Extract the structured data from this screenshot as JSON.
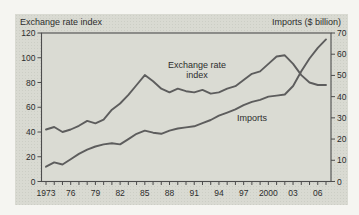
{
  "header": {
    "left": "Exchange rate index",
    "right": "Imports ($ billion)"
  },
  "annotations": {
    "exchange_line1": "Exchange rate",
    "exchange_line2": "index",
    "imports": "Imports"
  },
  "colors": {
    "panel_bg": "#d9dad2",
    "frame": "#4d4d4d",
    "line": "#5d5d5d",
    "text": "#2d2d2d"
  },
  "chart_data": {
    "type": "line",
    "x_range": [
      1973,
      2007
    ],
    "x": [
      1973,
      1974,
      1975,
      1976,
      1977,
      1978,
      1979,
      1980,
      1981,
      1982,
      1983,
      1984,
      1985,
      1986,
      1987,
      1988,
      1989,
      1990,
      1991,
      1992,
      1993,
      1994,
      1995,
      1996,
      1997,
      1998,
      1999,
      2000,
      2001,
      2002,
      2003,
      2004,
      2005,
      2006,
      2007
    ],
    "x_tick_years": [
      1973,
      1976,
      1979,
      1982,
      1985,
      1988,
      1991,
      1994,
      1997,
      2000,
      2003,
      2006
    ],
    "x_tick_labels": [
      "1973",
      "76",
      "79",
      "82",
      "85",
      "88",
      "91",
      "94",
      "97",
      "2000",
      "03",
      "06"
    ],
    "left_axis": {
      "label": "Exchange rate index",
      "range": [
        0,
        120
      ],
      "ticks": [
        0,
        20,
        40,
        60,
        80,
        100,
        120
      ],
      "tick_labels": [
        "0",
        "20",
        "40",
        "60",
        "80",
        "100",
        "120"
      ]
    },
    "right_axis": {
      "label": "Imports ($ billion)",
      "range": [
        0,
        70
      ],
      "ticks": [
        0,
        10,
        20,
        30,
        40,
        50,
        60,
        70
      ],
      "tick_labels": [
        "0",
        "10",
        "20",
        "30",
        "40",
        "50",
        "60",
        "70"
      ]
    },
    "grid": false,
    "legend": "in-plot text annotations",
    "series": [
      {
        "name": "Exchange rate index",
        "axis": "left",
        "values": [
          42,
          44,
          40,
          42,
          45,
          49,
          47,
          50,
          58,
          63,
          70,
          78,
          86,
          81,
          75,
          72,
          75,
          73,
          72,
          74,
          71,
          72,
          75,
          77,
          82,
          87,
          89,
          95,
          101,
          102,
          95,
          86,
          80,
          78,
          78
        ]
      },
      {
        "name": "Imports",
        "axis": "right",
        "values": [
          7,
          9,
          8,
          10.5,
          13,
          15,
          16.5,
          17.5,
          18,
          17.5,
          20,
          22.5,
          24,
          23,
          22.5,
          24,
          25,
          25.5,
          26,
          27.5,
          29,
          31,
          32.5,
          34,
          36,
          37.5,
          38.5,
          40,
          40.5,
          41,
          45,
          52,
          58,
          63,
          67
        ]
      }
    ]
  }
}
